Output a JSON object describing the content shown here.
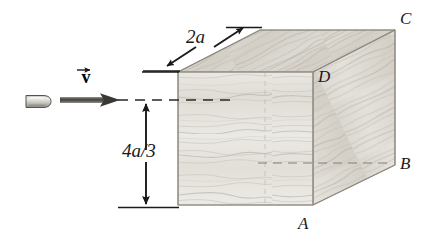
{
  "figure": {
    "background_color": "#ffffff",
    "ink_color": "#1a1a1a",
    "wood_light": "#e9e7e2",
    "wood_mid": "#d8d5ce",
    "wood_dark": "#c2bdb4"
  },
  "labels": {
    "corner_c": "C",
    "corner_d": "D",
    "corner_b": "B",
    "corner_a": "A",
    "width_dimension": "2a",
    "height_dimension": "4a/3",
    "velocity": "v"
  },
  "annotations": {
    "velocity_vector_name": "velocity-arrow",
    "trajectory_name": "bullet-trajectory-dashed-line",
    "projectile_name": "bullet"
  },
  "icons": {
    "bullet": "bullet-icon",
    "velocity_arrow": "right-arrow-icon",
    "height_arrow": "double-headed-vertical-arrow-icon",
    "width_arrow": "double-headed-diagonal-arrow-icon"
  }
}
